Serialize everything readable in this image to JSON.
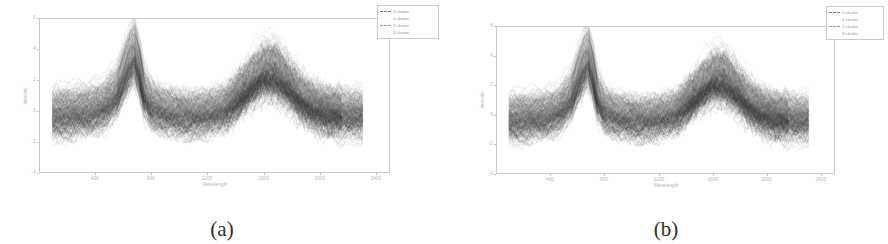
{
  "figure": {
    "background_color": "#ffffff",
    "panels": [
      {
        "id": "panel-a",
        "caption": "(a)",
        "chart_index": 0
      },
      {
        "id": "panel-b",
        "caption": "(b)",
        "chart_index": 1
      }
    ]
  },
  "chart_data": [
    {
      "type": "line",
      "title": "",
      "xlabel": "Wavelength",
      "ylabel": "Intensity",
      "xlim": [
        0,
        2500
      ],
      "ylim": [
        -4,
        6
      ],
      "grid": false,
      "legend_position": "upper right",
      "line_colors": [
        "#7a7a7a",
        "#555555",
        "#9a9a9a",
        "#3c3c3c"
      ],
      "xticks": [
        400,
        800,
        1200,
        1600,
        2000,
        2400
      ],
      "xtick_labels": [
        "400",
        "800",
        "1200",
        "1600",
        "2000",
        "2400"
      ],
      "yticks": [
        -4,
        -2,
        0,
        2,
        4,
        6
      ],
      "ytick_labels": [
        "-4",
        "-2",
        "0",
        "2",
        "4",
        "6"
      ],
      "legend": [
        {
          "label": "0 cluster",
          "color": "#7a7a7a",
          "has_marker_line": true
        },
        {
          "label": "1 cluster",
          "color": "#555555",
          "has_marker_line": false
        },
        {
          "label": "2 cluster",
          "color": "#9a9a9a",
          "has_marker_line": true
        },
        {
          "label": "3 cluster",
          "color": "#3c3c3c",
          "has_marker_line": false
        }
      ],
      "series": [
        {
          "name": "0 cluster",
          "color": "#7a7a7a",
          "n_curves": 120,
          "x": [
            0,
            150,
            300,
            420,
            520,
            600,
            660,
            700,
            740,
            800,
            900,
            1000,
            1100,
            1200,
            1300,
            1400,
            1500,
            1600,
            1700,
            1800,
            1900,
            2000,
            2100,
            2200,
            2300,
            2400
          ],
          "values": [
            0.55,
            0.62,
            0.78,
            1.05,
            1.9,
            3.35,
            4.15,
            3.2,
            1.85,
            1.05,
            0.72,
            0.55,
            0.48,
            0.5,
            0.62,
            0.85,
            1.35,
            2.0,
            2.45,
            2.3,
            1.55,
            0.9,
            0.6,
            0.5,
            0.48,
            0.45
          ]
        },
        {
          "name": "1 cluster",
          "color": "#555555",
          "n_curves": 160,
          "x": [
            0,
            150,
            300,
            420,
            520,
            600,
            660,
            700,
            740,
            800,
            900,
            1000,
            1100,
            1200,
            1300,
            1400,
            1500,
            1600,
            1700,
            1800,
            1900,
            2000,
            2100,
            2200,
            2300,
            2400
          ],
          "values": [
            0.1,
            0.15,
            0.3,
            0.6,
            1.4,
            2.9,
            3.8,
            2.75,
            1.35,
            0.6,
            0.3,
            0.18,
            0.12,
            0.15,
            0.25,
            0.5,
            1.0,
            1.65,
            2.1,
            1.95,
            1.2,
            0.55,
            0.25,
            0.15,
            0.12,
            0.1
          ]
        },
        {
          "name": "2 cluster",
          "color": "#9a9a9a",
          "n_curves": 140,
          "x": [
            0,
            150,
            300,
            420,
            520,
            600,
            660,
            700,
            740,
            800,
            900,
            1000,
            1100,
            1200,
            1300,
            1400,
            1500,
            1600,
            1700,
            1800,
            1900,
            2000,
            2100,
            2200,
            2300,
            2400
          ],
          "values": [
            -0.35,
            -0.3,
            -0.15,
            0.15,
            0.95,
            2.4,
            3.3,
            2.3,
            0.9,
            0.15,
            -0.15,
            -0.3,
            -0.35,
            -0.32,
            -0.2,
            0.05,
            0.55,
            1.2,
            1.6,
            1.45,
            0.75,
            0.1,
            -0.2,
            -0.3,
            -0.35,
            -0.35
          ]
        },
        {
          "name": "3 cluster",
          "color": "#3c3c3c",
          "n_curves": 180,
          "x": [
            0,
            150,
            300,
            420,
            520,
            600,
            660,
            700,
            740,
            800,
            900,
            1000,
            1100,
            1200,
            1300,
            1400,
            1500,
            1600,
            1700,
            1800,
            1900,
            2000,
            2100,
            2200,
            2300,
            2400
          ],
          "values": [
            -0.85,
            -0.8,
            -0.65,
            -0.35,
            0.45,
            1.9,
            2.8,
            1.8,
            0.4,
            -0.35,
            -0.7,
            -0.85,
            -0.9,
            -0.88,
            -0.75,
            -0.5,
            0.05,
            0.7,
            1.1,
            0.95,
            0.3,
            -0.4,
            -0.72,
            -0.82,
            -0.88,
            -0.9
          ]
        }
      ],
      "band_envelope": {
        "description": "dense overlapping spectra bundle, upper/lower envelope",
        "x": [
          0,
          150,
          300,
          420,
          520,
          600,
          660,
          700,
          740,
          800,
          900,
          1000,
          1100,
          1200,
          1300,
          1400,
          1500,
          1600,
          1700,
          1800,
          1900,
          2000,
          2100,
          2200,
          2300,
          2400
        ],
        "upper": [
          1.35,
          1.45,
          1.65,
          2.0,
          2.9,
          4.25,
          4.95,
          4.05,
          2.7,
          1.9,
          1.65,
          1.55,
          1.85,
          2.25,
          2.5,
          2.75,
          3.1,
          3.5,
          3.75,
          3.55,
          3.0,
          2.4,
          1.9,
          1.65,
          1.5,
          1.4
        ],
        "lower": [
          -1.4,
          -1.35,
          -1.2,
          -0.95,
          -0.3,
          1.15,
          2.05,
          1.0,
          -0.55,
          -1.35,
          -1.8,
          -2.0,
          -2.1,
          -2.1,
          -2.05,
          -1.95,
          -1.8,
          -1.7,
          -1.65,
          -1.75,
          -1.95,
          -2.1,
          -2.05,
          -1.95,
          -1.85,
          -1.75
        ]
      }
    },
    {
      "type": "line",
      "title": "",
      "xlabel": "Wavelength",
      "ylabel": "Intensity",
      "xlim": [
        0,
        2500
      ],
      "ylim": [
        -4,
        6
      ],
      "grid": false,
      "legend_position": "upper right",
      "line_colors": [
        "#7a7a7a",
        "#555555",
        "#9a9a9a",
        "#3c3c3c"
      ],
      "xticks": [
        400,
        800,
        1200,
        1600,
        2000,
        2400
      ],
      "xtick_labels": [
        "400",
        "800",
        "1200",
        "1600",
        "2000",
        "2400"
      ],
      "yticks": [
        -4,
        -2,
        0,
        2,
        4,
        6
      ],
      "ytick_labels": [
        "-4",
        "-2",
        "0",
        "2",
        "4",
        "6"
      ],
      "legend": [
        {
          "label": "0 cluster",
          "color": "#7a7a7a",
          "has_marker_line": true
        },
        {
          "label": "1 cluster",
          "color": "#555555",
          "has_marker_line": false
        },
        {
          "label": "2 cluster",
          "color": "#9a9a9a",
          "has_marker_line": true
        },
        {
          "label": "3 cluster",
          "color": "#3c3c3c",
          "has_marker_line": false
        }
      ],
      "series": [
        {
          "name": "0 cluster",
          "color": "#7a7a7a",
          "n_curves": 120,
          "x": [
            0,
            150,
            300,
            420,
            520,
            600,
            660,
            700,
            740,
            800,
            900,
            1000,
            1100,
            1200,
            1300,
            1400,
            1500,
            1600,
            1700,
            1800,
            1900,
            2000,
            2100,
            2200,
            2300,
            2400
          ],
          "values": [
            0.5,
            0.58,
            0.72,
            1.0,
            1.95,
            3.45,
            4.25,
            3.3,
            1.9,
            1.0,
            0.68,
            0.52,
            0.45,
            0.48,
            0.6,
            0.82,
            1.3,
            1.95,
            2.4,
            2.25,
            1.5,
            0.88,
            0.58,
            0.48,
            0.45,
            0.42
          ]
        },
        {
          "name": "1 cluster",
          "color": "#555555",
          "n_curves": 160,
          "x": [
            0,
            150,
            300,
            420,
            520,
            600,
            660,
            700,
            740,
            800,
            900,
            1000,
            1100,
            1200,
            1300,
            1400,
            1500,
            1600,
            1700,
            1800,
            1900,
            2000,
            2100,
            2200,
            2300,
            2400
          ],
          "values": [
            0.05,
            0.12,
            0.26,
            0.55,
            1.45,
            3.0,
            3.9,
            2.85,
            1.4,
            0.55,
            0.26,
            0.14,
            0.1,
            0.12,
            0.22,
            0.46,
            0.95,
            1.6,
            2.05,
            1.9,
            1.15,
            0.5,
            0.22,
            0.12,
            0.1,
            0.08
          ]
        },
        {
          "name": "2 cluster",
          "color": "#9a9a9a",
          "n_curves": 140,
          "x": [
            0,
            150,
            300,
            420,
            520,
            600,
            660,
            700,
            740,
            800,
            900,
            1000,
            1100,
            1200,
            1300,
            1400,
            1500,
            1600,
            1700,
            1800,
            1900,
            2000,
            2100,
            2200,
            2300,
            2400
          ],
          "values": [
            -0.4,
            -0.34,
            -0.18,
            0.12,
            1.0,
            2.5,
            3.4,
            2.4,
            0.95,
            0.12,
            -0.18,
            -0.33,
            -0.38,
            -0.35,
            -0.22,
            0.02,
            0.5,
            1.15,
            1.55,
            1.4,
            0.7,
            0.06,
            -0.24,
            -0.33,
            -0.38,
            -0.38
          ]
        },
        {
          "name": "3 cluster",
          "color": "#3c3c3c",
          "n_curves": 180,
          "x": [
            0,
            150,
            300,
            420,
            520,
            600,
            660,
            700,
            740,
            800,
            900,
            1000,
            1100,
            1200,
            1300,
            1400,
            1500,
            1600,
            1700,
            1800,
            1900,
            2000,
            2100,
            2200,
            2300,
            2400
          ],
          "values": [
            -0.9,
            -0.84,
            -0.68,
            -0.38,
            0.5,
            2.0,
            2.9,
            1.9,
            0.45,
            -0.38,
            -0.74,
            -0.88,
            -0.94,
            -0.9,
            -0.78,
            -0.52,
            0.02,
            0.66,
            1.06,
            0.9,
            0.26,
            -0.44,
            -0.76,
            -0.86,
            -0.92,
            -0.94
          ]
        }
      ],
      "band_envelope": {
        "description": "dense overlapping spectra bundle, upper/lower envelope",
        "x": [
          0,
          150,
          300,
          420,
          520,
          600,
          660,
          700,
          740,
          800,
          900,
          1000,
          1100,
          1200,
          1300,
          1400,
          1500,
          1600,
          1700,
          1800,
          1900,
          2000,
          2100,
          2200,
          2300,
          2400
        ],
        "upper": [
          1.3,
          1.4,
          1.6,
          1.95,
          2.95,
          4.35,
          5.05,
          4.15,
          2.75,
          1.85,
          1.6,
          1.5,
          1.8,
          2.2,
          2.45,
          2.7,
          3.05,
          3.45,
          3.7,
          3.5,
          2.95,
          2.35,
          1.85,
          1.6,
          1.45,
          1.35
        ],
        "lower": [
          -1.45,
          -1.4,
          -1.25,
          -1.0,
          -0.35,
          1.2,
          2.1,
          1.05,
          -0.6,
          -1.4,
          -1.85,
          -2.05,
          -2.15,
          -2.15,
          -2.1,
          -2.0,
          -1.85,
          -1.75,
          -1.7,
          -1.8,
          -2.0,
          -2.15,
          -2.1,
          -2.0,
          -1.9,
          -1.8
        ]
      }
    }
  ]
}
